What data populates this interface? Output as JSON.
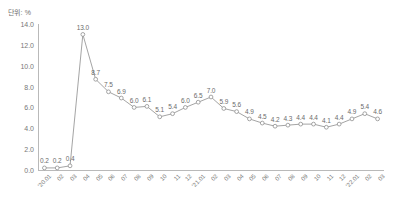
{
  "unit_label": "단위: %",
  "colors": {
    "line": "#9a9a9a",
    "marker_stroke": "#8f8f8f",
    "marker_fill": "#ffffff",
    "axis": "#b9b9b9",
    "tick_text": "#777777",
    "label_text": "#6b6b6b",
    "background": "#ffffff"
  },
  "chart_data": {
    "type": "line",
    "title": "",
    "xlabel": "",
    "ylabel": "",
    "unit": "%",
    "ylim": [
      0,
      14
    ],
    "yticks": [
      "0.0",
      "2.0",
      "4.0",
      "6.0",
      "8.0",
      "10.0",
      "12.0",
      "14.0"
    ],
    "ytick_values": [
      0,
      2,
      4,
      6,
      8,
      10,
      12,
      14
    ],
    "grid": false,
    "legend": "none",
    "marker": "open-circle",
    "show_data_labels": true,
    "categories": [
      "'20.01",
      "02",
      "03",
      "04",
      "05",
      "06",
      "07",
      "08",
      "09",
      "10",
      "11",
      "12",
      "'21.01",
      "02",
      "03",
      "04",
      "05",
      "06",
      "07",
      "08",
      "09",
      "10",
      "11",
      "12",
      "'22.01",
      "02",
      "03"
    ],
    "values": [
      0.2,
      0.2,
      0.4,
      13.0,
      8.7,
      7.5,
      6.9,
      6.0,
      6.1,
      5.1,
      5.4,
      6.0,
      6.5,
      7.0,
      5.9,
      5.6,
      4.9,
      4.5,
      4.2,
      4.3,
      4.4,
      4.4,
      4.1,
      4.4,
      4.9,
      5.4,
      4.9
    ],
    "data_labels": [
      "0.2",
      "0.2",
      "0.4",
      "13.0",
      "8.7",
      "7.5",
      "6.9",
      "6.0",
      "6.1",
      "5.1",
      "5.4",
      "6.0",
      "6.5",
      "7.0",
      "5.9",
      "5.6",
      "4.9",
      "4.5",
      "4.2",
      "4.3",
      "4.4",
      "4.4",
      "4.1",
      "4.4",
      "4.9",
      "5.4",
      "4.6"
    ]
  }
}
